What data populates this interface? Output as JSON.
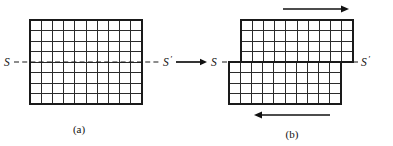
{
  "figure": {
    "background_color": "#ffffff",
    "line_color": "#2b2b2b",
    "border_color": "#1a1a1a",
    "arrow_color": "#111111",
    "panels": [
      {
        "id": "a",
        "caption": "(a)",
        "state": "undeformed",
        "grid": {
          "columns": 10,
          "rows": 8,
          "rows_above_plane": 4,
          "rows_below_plane": 4,
          "x": 30,
          "y": 20,
          "width": 112,
          "height": 84,
          "cell_width": 11.2,
          "cell_height": 10.5
        },
        "plane_label_left": "S",
        "plane_label_right": "S",
        "plane_label_right_prime": "′",
        "plane_y": 62,
        "plane_x_start": 10,
        "plane_x_end": 160,
        "shear_offset": 0,
        "arrows": []
      },
      {
        "id": "b",
        "caption": "(b)",
        "state": "slipped",
        "grid": {
          "columns": 10,
          "rows": 8,
          "rows_above_plane": 4,
          "rows_below_plane": 4,
          "x": 229,
          "y": 20,
          "width": 112,
          "height": 84,
          "cell_width": 11.2,
          "cell_height": 10.5
        },
        "plane_label_left": "S",
        "plane_label_right": "S",
        "plane_label_right_prime": "′",
        "plane_y": 62,
        "plane_x_start": 208,
        "plane_x_end": 365,
        "shear_offset": 12,
        "arrows": [
          {
            "name": "top-shear-arrow",
            "direction": "right",
            "x_start": 283,
            "x_end": 348,
            "y": 9
          },
          {
            "name": "bottom-shear-arrow",
            "direction": "left",
            "x_start": 330,
            "x_end": 254,
            "y": 115
          }
        ]
      }
    ],
    "connector_arrow": {
      "name": "panel-transition-arrow",
      "direction": "right",
      "x_start": 172,
      "x_end": 207,
      "y": 62
    }
  }
}
